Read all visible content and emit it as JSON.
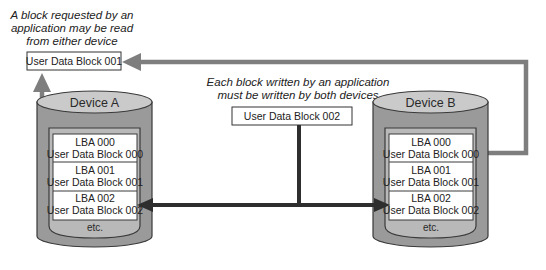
{
  "captions": {
    "read": [
      "A block requested by an",
      "application may be read",
      "from either device"
    ],
    "write": [
      "Each block written by an application",
      "must be written by both devices"
    ]
  },
  "read_block_label": "User Data Block 001",
  "write_block_label": "User Data Block 002",
  "devices": [
    {
      "title": "Device A",
      "blocks": [
        {
          "lba": "LBA 000",
          "data": "User Data Block 000"
        },
        {
          "lba": "LBA 001",
          "data": "User Data Block 001"
        },
        {
          "lba": "LBA 002",
          "data": "User Data Block 002"
        }
      ],
      "more": "etc."
    },
    {
      "title": "Device B",
      "blocks": [
        {
          "lba": "LBA 000",
          "data": "User Data Block 000"
        },
        {
          "lba": "LBA 001",
          "data": "User Data Block 001"
        },
        {
          "lba": "LBA 002",
          "data": "User Data Block 002"
        }
      ],
      "more": "etc."
    }
  ],
  "colors": {
    "cylinder_body": "#9a9a9a",
    "cylinder_top": "#c9c9c9",
    "cylinder_outline": "#3a3a3a",
    "inner_panel": "#b5b5b5",
    "block_fill": "#ffffff",
    "read_arrow": "#7a7a7a",
    "write_arrow": "#2e2e2e"
  }
}
